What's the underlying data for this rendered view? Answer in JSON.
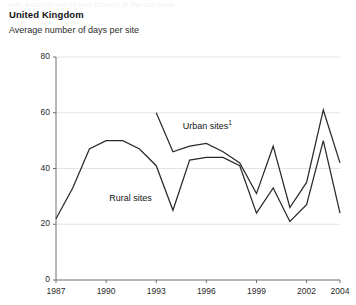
{
  "header": {
    "title": "United Kingdom",
    "subtitle": "Average number of days per site",
    "top_remnant": "with a partial line of text clipped at the top edge"
  },
  "labels": {
    "urban": "Urban sites",
    "urban_footnote": "1",
    "rural": "Rural sites"
  },
  "axis": {
    "y_ticks": [
      "0",
      "20",
      "40",
      "60",
      "80"
    ],
    "x_ticks": [
      "1987",
      "1990",
      "1993",
      "1996",
      "1999",
      "2002",
      "2004"
    ]
  },
  "colors": {
    "line": "#2a2a2a",
    "grid": "#e3e3e3",
    "axis": "#6e6e6e",
    "text": "#1a1a1a",
    "background": "#ffffff"
  },
  "chart_data": {
    "type": "line",
    "title": "United Kingdom",
    "subtitle": "Average number of days per site",
    "xlabel": "",
    "ylabel": "Average number of days per site",
    "xlim": [
      1987,
      2004
    ],
    "ylim": [
      0,
      80
    ],
    "yticks": [
      0,
      20,
      40,
      60,
      80
    ],
    "xticks": [
      1987,
      1990,
      1993,
      1996,
      1999,
      2002,
      2004
    ],
    "grid": "horizontal",
    "legend": "inline-annotations",
    "x": [
      1987,
      1988,
      1989,
      1990,
      1991,
      1992,
      1993,
      1994,
      1995,
      1996,
      1997,
      1998,
      1999,
      2000,
      2001,
      2002,
      2003,
      2004
    ],
    "series": [
      {
        "name": "Rural sites",
        "x": [
          1987,
          1988,
          1989,
          1990,
          1991,
          1992,
          1993,
          1994,
          1995,
          1996,
          1997,
          1998,
          1999,
          2000,
          2001,
          2002,
          2003,
          2004
        ],
        "values": [
          22,
          33,
          47,
          50,
          50,
          47,
          41,
          25,
          43,
          44,
          44,
          41,
          24,
          33,
          21,
          27,
          50,
          24
        ]
      },
      {
        "name": "Urban sites",
        "x": [
          1993,
          1994,
          1995,
          1996,
          1997,
          1998,
          1999,
          2000,
          2001,
          2002,
          2003,
          2004
        ],
        "values": [
          60,
          46,
          48,
          49,
          46,
          42,
          31,
          48,
          26,
          35,
          61,
          42
        ]
      }
    ],
    "annotations": [
      {
        "text": "Urban sites1",
        "x": 1995,
        "y": 55
      },
      {
        "text": "Rural sites",
        "x": 1991.5,
        "y": 29
      }
    ]
  }
}
